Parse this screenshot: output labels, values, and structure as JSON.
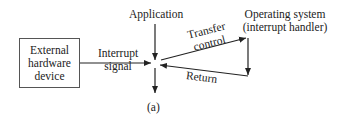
{
  "diagram": {
    "nodes": {
      "external_device": {
        "label_lines": [
          "External",
          "hardware",
          "device"
        ]
      },
      "application": {
        "label": "Application"
      },
      "os": {
        "label_line1": "Operating system",
        "label_line2": "(interrupt handler)"
      }
    },
    "edges": {
      "interrupt": {
        "label_line1": "Interrupt",
        "label_line2": "signal"
      },
      "transfer": {
        "label_line1": "Transfer",
        "label_line2": "control"
      },
      "return": {
        "label": "Return"
      }
    },
    "caption": "(a)",
    "colors": {
      "line": "#222222",
      "box_border": "#555555",
      "background": "#ffffff"
    }
  }
}
